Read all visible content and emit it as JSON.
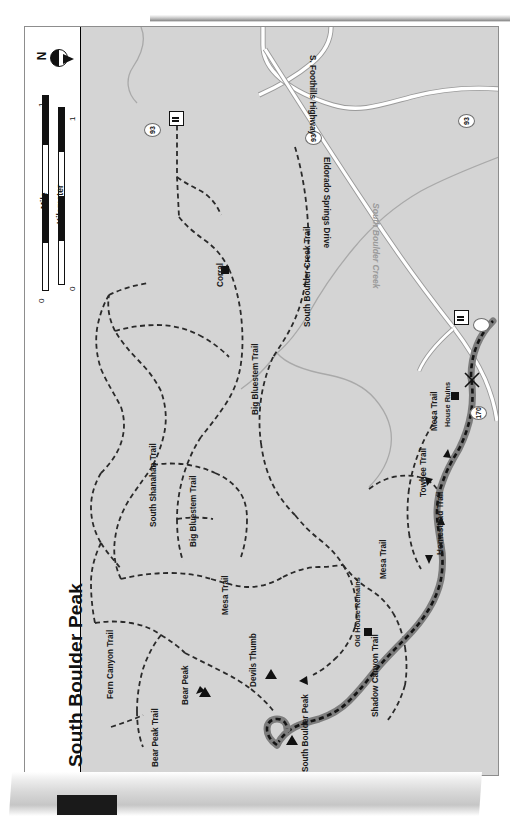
{
  "map": {
    "title": "South Boulder Peak",
    "orientation": "rotated-90",
    "background_color": "#d4d4d4",
    "frame_border_color": "#8d8d8d",
    "north_arrow_label": "N",
    "scale": {
      "kilometer_label": "Kilometer",
      "mile_label": "Mile",
      "km_ticks": [
        "0",
        "1"
      ],
      "mi_ticks": [
        "0",
        "1"
      ]
    },
    "trails": [
      {
        "name": "Fern Canyon Trail",
        "style": "dashed"
      },
      {
        "name": "Bear Peak Trail",
        "style": "dashed"
      },
      {
        "name": "Mesa Trail",
        "style": "dashed"
      },
      {
        "name": "South Shanahan Trail",
        "style": "dashed"
      },
      {
        "name": "Big Bluestem Trail",
        "style": "dashed"
      },
      {
        "name": "South Boulder Creek Trail",
        "style": "dashed"
      },
      {
        "name": "Towhee Trail",
        "style": "dashed"
      },
      {
        "name": "Homestead Trail",
        "style": "dashed"
      },
      {
        "name": "Shadow Canyon Trail",
        "style": "highlighted-route"
      }
    ],
    "roads": [
      {
        "name": "S. Foothills Highway",
        "style": "highway"
      },
      {
        "name": "Eldorado Springs Drive",
        "style": "highway"
      }
    ],
    "waterways": [
      {
        "name": "South Boulder Creek",
        "style": "stream"
      }
    ],
    "peaks": [
      {
        "name": "Bear Peak",
        "marker": "triangle"
      },
      {
        "name": "Devils Thumb",
        "marker": "triangle"
      },
      {
        "name": "South Boulder Peak",
        "marker": "triangle"
      }
    ],
    "points_of_interest": [
      {
        "name": "Corral",
        "marker": "square"
      },
      {
        "name": "Old House Remains",
        "marker": "square"
      },
      {
        "name": "House Ruins",
        "marker": "square"
      }
    ],
    "trailheads": [
      {
        "name": "trailhead-north",
        "marker": "trailhead-icon"
      },
      {
        "name": "trailhead-southeast",
        "marker": "trailhead-icon"
      }
    ],
    "route_shields": [
      {
        "number": "93"
      },
      {
        "number": "93"
      },
      {
        "number": "93"
      },
      {
        "number": "170"
      }
    ]
  }
}
